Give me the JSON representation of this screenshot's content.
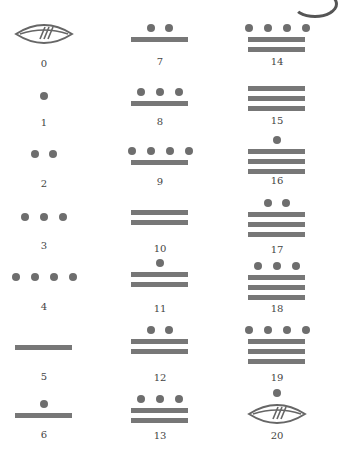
{
  "colors": {
    "glyph": "#777777",
    "dot": "#6e6e6e",
    "label": "#444444",
    "shell": "#666666"
  },
  "numerals": [
    {
      "value": 0,
      "label": "0",
      "dots": 0,
      "bars": 0,
      "shell": true,
      "col": 0,
      "glyph_y": 22,
      "label_y": 58
    },
    {
      "value": 1,
      "label": "1",
      "dots": 1,
      "bars": 0,
      "shell": false,
      "col": 0,
      "glyph_y": 92,
      "label_y": 117
    },
    {
      "value": 2,
      "label": "2",
      "dots": 2,
      "bars": 0,
      "shell": false,
      "col": 0,
      "glyph_y": 150,
      "label_y": 178
    },
    {
      "value": 3,
      "label": "3",
      "dots": 3,
      "bars": 0,
      "shell": false,
      "col": 0,
      "glyph_y": 213,
      "label_y": 240
    },
    {
      "value": 4,
      "label": "4",
      "dots": 4,
      "bars": 0,
      "shell": false,
      "col": 0,
      "glyph_y": 273,
      "label_y": 301
    },
    {
      "value": 5,
      "label": "5",
      "dots": 0,
      "bars": 1,
      "shell": false,
      "col": 0,
      "glyph_y": 345,
      "label_y": 371
    },
    {
      "value": 6,
      "label": "6",
      "dots": 1,
      "bars": 1,
      "shell": false,
      "col": 0,
      "glyph_y": 400,
      "label_y": 429
    },
    {
      "value": 7,
      "label": "7",
      "dots": 2,
      "bars": 1,
      "shell": false,
      "col": 1,
      "glyph_y": 24,
      "label_y": 56
    },
    {
      "value": 8,
      "label": "8",
      "dots": 3,
      "bars": 1,
      "shell": false,
      "col": 1,
      "glyph_y": 88,
      "label_y": 116
    },
    {
      "value": 9,
      "label": "9",
      "dots": 4,
      "bars": 1,
      "shell": false,
      "col": 1,
      "glyph_y": 147,
      "label_y": 176
    },
    {
      "value": 10,
      "label": "10",
      "dots": 0,
      "bars": 2,
      "shell": false,
      "col": 1,
      "glyph_y": 210,
      "label_y": 243
    },
    {
      "value": 11,
      "label": "11",
      "dots": 1,
      "bars": 2,
      "shell": false,
      "col": 1,
      "glyph_y": 259,
      "label_y": 303
    },
    {
      "value": 12,
      "label": "12",
      "dots": 2,
      "bars": 2,
      "shell": false,
      "col": 1,
      "glyph_y": 326,
      "label_y": 372
    },
    {
      "value": 13,
      "label": "13",
      "dots": 3,
      "bars": 2,
      "shell": false,
      "col": 1,
      "glyph_y": 395,
      "label_y": 430
    },
    {
      "value": 14,
      "label": "14",
      "dots": 4,
      "bars": 2,
      "shell": false,
      "col": 2,
      "glyph_y": 24,
      "label_y": 56
    },
    {
      "value": 15,
      "label": "15",
      "dots": 0,
      "bars": 3,
      "shell": false,
      "col": 2,
      "glyph_y": 86,
      "label_y": 115
    },
    {
      "value": 16,
      "label": "16",
      "dots": 1,
      "bars": 3,
      "shell": false,
      "col": 2,
      "glyph_y": 136,
      "label_y": 175
    },
    {
      "value": 17,
      "label": "17",
      "dots": 2,
      "bars": 3,
      "shell": false,
      "col": 2,
      "glyph_y": 199,
      "label_y": 244
    },
    {
      "value": 18,
      "label": "18",
      "dots": 3,
      "bars": 3,
      "shell": false,
      "col": 2,
      "glyph_y": 262,
      "label_y": 303
    },
    {
      "value": 19,
      "label": "19",
      "dots": 4,
      "bars": 3,
      "shell": false,
      "col": 2,
      "glyph_y": 326,
      "label_y": 372
    },
    {
      "value": 20,
      "label": "20",
      "dots": 1,
      "bars": 0,
      "shell": true,
      "col": 2,
      "glyph_y": 389,
      "label_y": 430
    }
  ]
}
